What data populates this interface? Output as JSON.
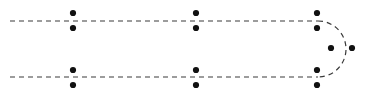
{
  "figure": {
    "title": "",
    "width": 367,
    "height": 97,
    "background": "#ffffff"
  },
  "chart_data": {
    "type": "scatter",
    "title": "",
    "subtitle": "",
    "xlabel": "",
    "ylabel": "",
    "xlim": [
      0,
      367
    ],
    "ylim": [
      0,
      97
    ],
    "grid": false,
    "legend": null,
    "annotations": [],
    "paths": [
      {
        "name": "upper-track",
        "style": "dashed",
        "color": "#3a3a3a",
        "stroke_width": 1.2,
        "dash_pattern": "5,4",
        "x": [
          10,
          318
        ],
        "y": [
          21,
          21
        ]
      },
      {
        "name": "lower-track",
        "style": "dashed",
        "color": "#3a3a3a",
        "stroke_width": 1.2,
        "dash_pattern": "5,4",
        "x": [
          10,
          318
        ],
        "y": [
          77,
          77
        ]
      },
      {
        "name": "u-turn-arc",
        "style": "dashed",
        "color": "#3a3a3a",
        "stroke_width": 1.2,
        "dash_pattern": "5,4",
        "shape": "semicircle",
        "center_x": 318,
        "center_y": 49,
        "radius": 28,
        "start_angle_deg": -90,
        "end_angle_deg": 90,
        "rightmost_x": 346
      }
    ],
    "series": [
      {
        "name": "markers",
        "marker": "circle",
        "marker_color": "#111111",
        "marker_radius": 3.1,
        "points": [
          {
            "x": 73,
            "y": 13
          },
          {
            "x": 73,
            "y": 28
          },
          {
            "x": 196,
            "y": 13
          },
          {
            "x": 196,
            "y": 28
          },
          {
            "x": 317,
            "y": 13
          },
          {
            "x": 317,
            "y": 28
          },
          {
            "x": 331,
            "y": 48
          },
          {
            "x": 352,
            "y": 48
          },
          {
            "x": 73,
            "y": 70
          },
          {
            "x": 73,
            "y": 85
          },
          {
            "x": 196,
            "y": 70
          },
          {
            "x": 196,
            "y": 85
          },
          {
            "x": 317,
            "y": 70
          },
          {
            "x": 317,
            "y": 85
          }
        ]
      }
    ]
  }
}
